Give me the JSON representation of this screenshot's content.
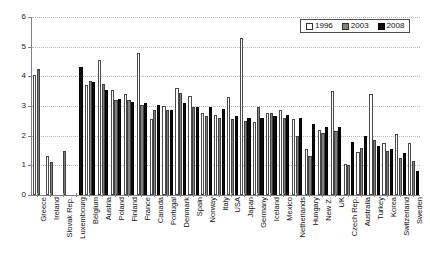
{
  "chart_data": {
    "type": "bar",
    "title": "",
    "subtitle": "",
    "xlabel": "",
    "ylabel": "",
    "ylim": [
      0,
      6
    ],
    "yticks": [
      0,
      1,
      2,
      3,
      4,
      5,
      6
    ],
    "ytick_labels": [
      "0",
      "1",
      "2",
      "3",
      "4",
      "5",
      "6"
    ],
    "grid": true,
    "legend_position": "top-right",
    "legend": [
      "1996",
      "2003",
      "2008"
    ],
    "series_colors": {
      "1996": "#ffffff",
      "2003": "#808080",
      "2008": "#0d0d0d"
    },
    "categories": [
      "Greece",
      "Ireland",
      "Slovak Rep.",
      "Luxembourg",
      "Belgium",
      "Austria",
      "Poland",
      "Finland",
      "France",
      "Canada",
      "Portugal",
      "Denmark",
      "Spain",
      "Norway",
      "Italy",
      "USA",
      "Japan",
      "Germany",
      "Iceland",
      "Mexico",
      "Netherlands",
      "Hungary",
      "New Z.",
      "UK",
      "Czech Rep.",
      "Australia",
      "Turkey",
      "Korea",
      "Switzerland",
      "Sweden"
    ],
    "series": [
      {
        "name": "1996",
        "values": [
          4.05,
          1.3,
          null,
          null,
          3.7,
          4.55,
          3.55,
          3.4,
          4.8,
          2.55,
          3.0,
          3.6,
          3.35,
          2.75,
          2.7,
          3.3,
          5.3,
          2.45,
          2.75,
          2.85,
          2.55,
          1.55,
          2.2,
          3.5,
          1.05,
          1.45,
          3.4,
          1.75,
          2.05,
          1.75
        ]
      },
      {
        "name": "2003",
        "values": [
          4.25,
          1.1,
          1.5,
          null,
          3.85,
          3.75,
          3.2,
          3.2,
          3.05,
          2.85,
          2.85,
          3.45,
          2.95,
          2.65,
          2.6,
          2.55,
          2.5,
          2.95,
          2.75,
          2.6,
          2.0,
          1.3,
          2.1,
          2.15,
          1.0,
          1.6,
          1.85,
          1.5,
          1.25,
          1.15
        ]
      },
      {
        "name": "2008",
        "values": [
          null,
          null,
          null,
          4.3,
          3.8,
          3.55,
          3.25,
          3.15,
          3.1,
          3.05,
          2.85,
          3.1,
          2.95,
          2.95,
          2.9,
          2.65,
          2.6,
          2.6,
          2.65,
          2.7,
          2.6,
          2.4,
          2.3,
          2.3,
          1.8,
          2.0,
          1.65,
          1.55,
          1.4,
          0.8
        ]
      }
    ]
  }
}
